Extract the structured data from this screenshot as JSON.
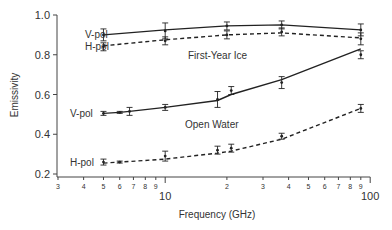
{
  "chart_data": {
    "type": "line",
    "title": "",
    "xlabel": "Frequency (GHz)",
    "ylabel": "Emissivity",
    "xscale": "log",
    "xlim": [
      3,
      100
    ],
    "ylim": [
      0.2,
      1.0
    ],
    "yticks": [
      0.2,
      0.4,
      0.6,
      0.8,
      1.0
    ],
    "ytick_labels": [
      "0.2",
      "0.4",
      "0.6",
      "0.8",
      "1.0"
    ],
    "xticks_major": [
      10,
      100
    ],
    "xtick_major_labels": [
      "10",
      "100"
    ],
    "xticks_minor": [
      3,
      4,
      5,
      6,
      7,
      8,
      9,
      20,
      30,
      40,
      50,
      60,
      70,
      80,
      90
    ],
    "xtick_minor_labels": [
      "3",
      "4",
      "5",
      "6",
      "7",
      "8",
      "9",
      "2",
      "3",
      "4",
      "5",
      "6",
      "7",
      "8",
      "9"
    ],
    "grid": false,
    "legend": "inline labels",
    "annotations": [
      {
        "text": "First-Year Ice",
        "x": 20,
        "y": 0.84
      },
      {
        "text": "Open Water",
        "x": 20,
        "y": 0.44
      }
    ],
    "series": [
      {
        "name": "First-Year Ice V-pol",
        "label": "V-pol",
        "style": "solid",
        "line_x": [
          5,
          10,
          20,
          37,
          90
        ],
        "line_y": [
          0.9,
          0.925,
          0.945,
          0.95,
          0.925
        ],
        "points": [
          {
            "x": 5,
            "y": 0.9,
            "err": 0.03
          },
          {
            "x": 10,
            "y": 0.92,
            "err": 0.04
          },
          {
            "x": 20,
            "y": 0.945,
            "err": 0.02
          },
          {
            "x": 37,
            "y": 0.95,
            "err": 0.02
          },
          {
            "x": 90,
            "y": 0.925,
            "err": 0.03
          }
        ]
      },
      {
        "name": "First-Year Ice H-pol",
        "label": "H-pol",
        "style": "dashed",
        "line_x": [
          5,
          10,
          20,
          37,
          90
        ],
        "line_y": [
          0.845,
          0.875,
          0.9,
          0.91,
          0.885
        ],
        "points": [
          {
            "x": 5,
            "y": 0.84,
            "err": 0.02
          },
          {
            "x": 10,
            "y": 0.87,
            "err": 0.02
          },
          {
            "x": 20,
            "y": 0.9,
            "err": 0.02
          },
          {
            "x": 37,
            "y": 0.915,
            "err": 0.02
          },
          {
            "x": 90,
            "y": 0.88,
            "err": 0.03
          }
        ]
      },
      {
        "name": "Open Water V-pol",
        "label": "V-pol",
        "style": "solid",
        "line_x": [
          5,
          6,
          6.7,
          10,
          18,
          21,
          37,
          90
        ],
        "line_y": [
          0.505,
          0.51,
          0.515,
          0.535,
          0.57,
          0.6,
          0.675,
          0.83
        ],
        "points": [
          {
            "x": 5,
            "y": 0.505,
            "err": 0.01
          },
          {
            "x": 6,
            "y": 0.51,
            "err": 0.005
          },
          {
            "x": 6.7,
            "y": 0.515,
            "err": 0.02
          },
          {
            "x": 10,
            "y": 0.535,
            "err": 0.015
          },
          {
            "x": 18,
            "y": 0.575,
            "err": 0.04
          },
          {
            "x": 21,
            "y": 0.62,
            "err": 0.02
          },
          {
            "x": 37,
            "y": 0.66,
            "err": 0.03
          },
          {
            "x": 90,
            "y": 0.8,
            "err": 0.02
          }
        ]
      },
      {
        "name": "Open Water H-pol",
        "label": "H-pol",
        "style": "dashed",
        "line_x": [
          5,
          6,
          6.7,
          10,
          18,
          21,
          37,
          90
        ],
        "line_y": [
          0.255,
          0.26,
          0.263,
          0.275,
          0.305,
          0.315,
          0.375,
          0.53
        ],
        "points": [
          {
            "x": 5,
            "y": 0.26,
            "err": 0.015
          },
          {
            "x": 6,
            "y": 0.26,
            "err": 0.005
          },
          {
            "x": 10,
            "y": 0.29,
            "err": 0.025
          },
          {
            "x": 18,
            "y": 0.32,
            "err": 0.02
          },
          {
            "x": 21,
            "y": 0.33,
            "err": 0.02
          },
          {
            "x": 37,
            "y": 0.39,
            "err": 0.015
          },
          {
            "x": 90,
            "y": 0.53,
            "err": 0.02
          }
        ]
      }
    ]
  },
  "labels": {
    "ylabel": "Emissivity",
    "xlabel": "Frequency (GHz)",
    "ice_title": "First-Year Ice",
    "water_title": "Open Water",
    "vpol": "V-pol",
    "hpol": "H-pol"
  },
  "colors": {
    "line": "#222222",
    "axis": "#444444",
    "text": "#333333"
  }
}
